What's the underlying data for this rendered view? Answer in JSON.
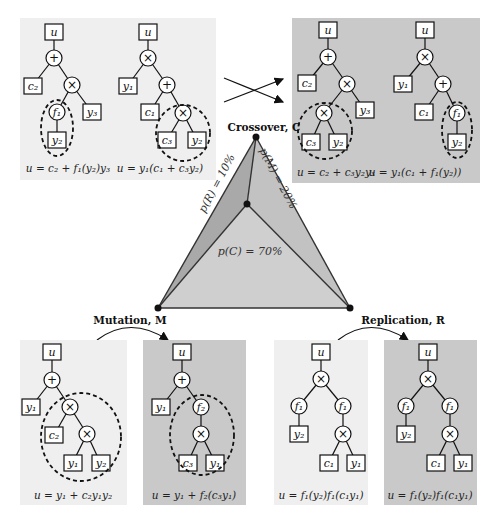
{
  "operations": {
    "crossover": {
      "label": "Crossover, C",
      "probability_label": "p(C) = 70%",
      "probability": 70
    },
    "mutation": {
      "label": "Mutation, M",
      "probability_label": "p(M) = 20%",
      "probability": 20
    },
    "replication": {
      "label": "Replication, R",
      "probability_label": "p(R) = 10%",
      "probability": 10
    }
  },
  "crossover_panels": {
    "parent1": {
      "equation": "u = c₂ + f₁(y₂)y₃"
    },
    "parent2": {
      "equation": "u = y₁(c₁ + c₃y₂)"
    },
    "child1": {
      "equation": "u = c₂ + c₃y₂y₃"
    },
    "child2": {
      "equation": "u = y₁(c₁ + f₁(y₂))"
    }
  },
  "mutation_panels": {
    "before": {
      "equation": "u = y₁ + c₂y₁y₂"
    },
    "after": {
      "equation": "u = y₁ + f₂(c₃y₁)"
    }
  },
  "replication_panels": {
    "before": {
      "equation": "u = f₁(y₂)f₁(c₁y₁)"
    },
    "after": {
      "equation": "u = f₁(y₂)f₁(c₁y₁)"
    }
  },
  "nodes": {
    "u": "u",
    "plus": "+",
    "times": "×",
    "c1": "c₁",
    "c2": "c₂",
    "c3": "c₃",
    "y1": "y₁",
    "y2": "y₂",
    "y3": "y₃",
    "f1": "f₁",
    "f2": "f₂"
  },
  "colors": {
    "panel_light": "#efefef",
    "panel_dark": "#c9c9c9",
    "triangle_light": "#cfcfcf",
    "triangle_dark": "#a9a9a9"
  }
}
